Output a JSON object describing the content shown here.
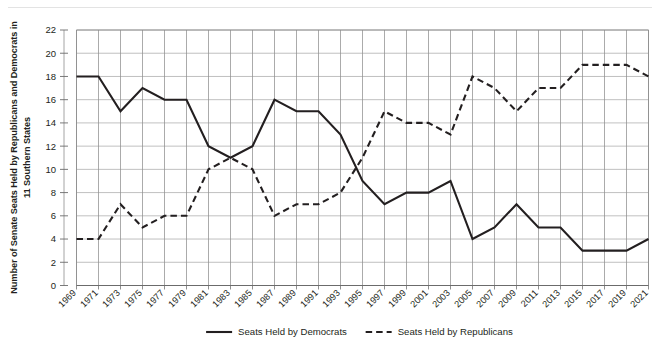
{
  "chart_data": {
    "type": "line",
    "title": "",
    "xlabel": "",
    "ylabel": "Number of Senate Seats Held by Republicans and Democrats in 11 Southern States",
    "ylim": [
      0,
      22
    ],
    "ytick_step": 2,
    "yticks": [
      0,
      2,
      4,
      6,
      8,
      10,
      12,
      14,
      16,
      18,
      20,
      22
    ],
    "grid": true,
    "legend_position": "bottom",
    "categories": [
      "1969",
      "1971",
      "1973",
      "1975",
      "1977",
      "1979",
      "1981",
      "1983",
      "1985",
      "1987",
      "1989",
      "1991",
      "1993",
      "1995",
      "1997",
      "1999",
      "2001",
      "2003",
      "2005",
      "2007",
      "2009",
      "2011",
      "2013",
      "2015",
      "2017",
      "2019",
      "2021"
    ],
    "series": [
      {
        "name": "Seats Held by Democrats",
        "style": "solid",
        "color": "#231f20",
        "values": [
          18,
          18,
          15,
          17,
          16,
          16,
          12,
          11,
          12,
          16,
          15,
          15,
          13,
          9,
          7,
          8,
          8,
          9,
          4,
          5,
          7,
          5,
          5,
          3,
          3,
          3,
          4
        ]
      },
      {
        "name": "Seats Held by Republicans",
        "style": "dashed",
        "color": "#231f20",
        "values": [
          4,
          4,
          7,
          5,
          6,
          6,
          10,
          11,
          10,
          6,
          7,
          7,
          8,
          11,
          15,
          14,
          14,
          13,
          18,
          17,
          15,
          17,
          17,
          19,
          19,
          19,
          18
        ]
      }
    ]
  },
  "legend": {
    "items": [
      {
        "label": "Seats Held by Democrats",
        "style": "solid"
      },
      {
        "label": "Seats Held by Republicans",
        "style": "dashed"
      }
    ]
  }
}
